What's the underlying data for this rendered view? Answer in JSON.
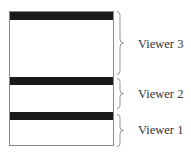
{
  "diagram": {
    "title": "",
    "viewers": [
      {
        "id": "viewer-3",
        "label": "Viewer 3"
      },
      {
        "id": "viewer-2",
        "label": "Viewer 2"
      },
      {
        "id": "viewer-1",
        "label": "Viewer 1"
      }
    ]
  },
  "colors": {
    "title_bar": "#1a1a1a",
    "border": "#8a8a8a",
    "brace": "#8a8a8a",
    "text": "#333333",
    "background": "#ffffff"
  }
}
